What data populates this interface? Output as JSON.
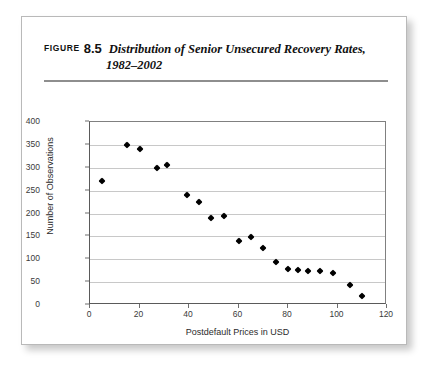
{
  "figure": {
    "label": "FIGURE",
    "number": "8.5",
    "title_line1": "Distribution of Senior Unsecured Recovery Rates,",
    "title_line2": "1982–2002"
  },
  "chart_data": {
    "type": "scatter",
    "title": "Distribution of Senior Unsecured Recovery Rates, 1982–2002",
    "xlabel": "Postdefault Prices in USD",
    "ylabel": "Number of Observations",
    "xlim": [
      0,
      120
    ],
    "ylim": [
      0,
      400
    ],
    "xticks": [
      0,
      20,
      40,
      60,
      80,
      100,
      120
    ],
    "yticks": [
      0,
      50,
      100,
      150,
      200,
      250,
      300,
      350,
      400
    ],
    "grid": "horizontal",
    "legend": null,
    "marker": "diamond",
    "marker_color": "#000000",
    "points": [
      {
        "x": 5,
        "y": 271
      },
      {
        "x": 15,
        "y": 349
      },
      {
        "x": 20,
        "y": 340
      },
      {
        "x": 27,
        "y": 300
      },
      {
        "x": 31,
        "y": 305
      },
      {
        "x": 39,
        "y": 240
      },
      {
        "x": 44,
        "y": 225
      },
      {
        "x": 49,
        "y": 190
      },
      {
        "x": 54,
        "y": 195
      },
      {
        "x": 60,
        "y": 139
      },
      {
        "x": 65,
        "y": 149
      },
      {
        "x": 70,
        "y": 125
      },
      {
        "x": 75,
        "y": 94
      },
      {
        "x": 80,
        "y": 79
      },
      {
        "x": 84,
        "y": 77
      },
      {
        "x": 88,
        "y": 75
      },
      {
        "x": 93,
        "y": 74
      },
      {
        "x": 98,
        "y": 69
      },
      {
        "x": 105,
        "y": 44
      },
      {
        "x": 110,
        "y": 19
      }
    ]
  }
}
